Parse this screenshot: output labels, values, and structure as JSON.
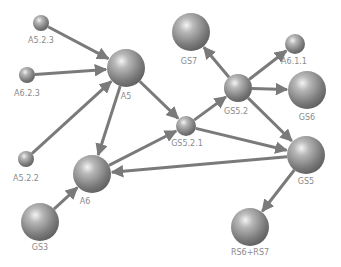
{
  "diagram": {
    "type": "directed-graph",
    "colors": {
      "node": "#7d7d7d",
      "edge": "#7a7a7a",
      "label": "#8a8a8a",
      "background": "#ffffff"
    },
    "nodes": [
      {
        "id": "A5.2.3",
        "label": "A5.2.3",
        "x": 41,
        "y": 23,
        "r": 8,
        "lx": 41,
        "ly": 43
      },
      {
        "id": "A6.2.3",
        "label": "A6.2.3",
        "x": 27,
        "y": 75,
        "r": 8,
        "lx": 27,
        "ly": 96
      },
      {
        "id": "A5.2.2",
        "label": "A5.2.2",
        "x": 26,
        "y": 159,
        "r": 8,
        "lx": 26,
        "ly": 181
      },
      {
        "id": "A5",
        "label": "A5",
        "x": 126,
        "y": 68,
        "r": 19,
        "lx": 126,
        "ly": 99
      },
      {
        "id": "A6",
        "label": "A6",
        "x": 92,
        "y": 174,
        "r": 19,
        "lx": 85,
        "ly": 204
      },
      {
        "id": "GS3",
        "label": "GS3",
        "x": 40,
        "y": 222,
        "r": 19,
        "lx": 40,
        "ly": 250
      },
      {
        "id": "GS5.2.1",
        "label": "GS5.2.1",
        "x": 186,
        "y": 126,
        "r": 10,
        "lx": 187,
        "ly": 146
      },
      {
        "id": "GS7",
        "label": "GS7",
        "x": 191,
        "y": 32,
        "r": 19,
        "lx": 189,
        "ly": 64
      },
      {
        "id": "A6.1.1",
        "label": "A6.1.1",
        "x": 295,
        "y": 44,
        "r": 10,
        "lx": 294,
        "ly": 64
      },
      {
        "id": "GS5.2",
        "label": "GS5.2",
        "x": 238,
        "y": 88,
        "r": 14,
        "lx": 236,
        "ly": 114
      },
      {
        "id": "GS6",
        "label": "GS6",
        "x": 307,
        "y": 90,
        "r": 19,
        "lx": 307,
        "ly": 120
      },
      {
        "id": "GS5",
        "label": "GS5",
        "x": 306,
        "y": 155,
        "r": 19,
        "lx": 306,
        "ly": 184
      },
      {
        "id": "RS6+RS7",
        "label": "RS6+RS7",
        "x": 250,
        "y": 227,
        "r": 19,
        "lx": 250,
        "ly": 255
      }
    ],
    "edges": [
      {
        "from": "A5.2.3",
        "to": "A5"
      },
      {
        "from": "A6.2.3",
        "to": "A5"
      },
      {
        "from": "A5.2.2",
        "to": "A5"
      },
      {
        "from": "A5",
        "to": "A6"
      },
      {
        "from": "A5",
        "to": "GS5.2.1"
      },
      {
        "from": "A6",
        "to": "GS5.2.1"
      },
      {
        "from": "GS3",
        "to": "A6"
      },
      {
        "from": "GS5.2.1",
        "to": "GS5.2"
      },
      {
        "from": "GS5.2.1",
        "to": "GS5"
      },
      {
        "from": "GS5.2",
        "to": "GS7"
      },
      {
        "from": "GS5.2",
        "to": "A6.1.1"
      },
      {
        "from": "GS5.2",
        "to": "GS6"
      },
      {
        "from": "GS5.2",
        "to": "GS5"
      },
      {
        "from": "GS5",
        "to": "A6"
      },
      {
        "from": "GS5",
        "to": "RS6+RS7"
      }
    ]
  }
}
